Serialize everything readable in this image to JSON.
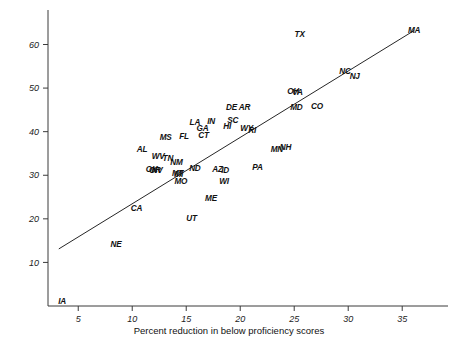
{
  "figure": {
    "background_color": "#ffffff",
    "axis_color": "#3b3b3b",
    "line_color": "#262626",
    "label_color": "#111111"
  },
  "chart_data": {
    "type": "scatter",
    "title": "",
    "subtitle": "",
    "xlabel": "Percent reduction in below proficiency scores",
    "ylabel": "",
    "xlim": [
      2.2,
      38.5
    ],
    "ylim": [
      0,
      67
    ],
    "xticks": [
      5,
      10,
      15,
      20,
      25,
      30,
      35
    ],
    "yticks": [
      10,
      20,
      30,
      40,
      50,
      60
    ],
    "grid": false,
    "legend": null,
    "point_marker": "text-label",
    "annotations": [
      {
        "label": "IA",
        "x": 3.5,
        "y": 0.4
      },
      {
        "label": "NE",
        "x": 8.5,
        "y": 13.6
      },
      {
        "label": "CA",
        "x": 10.4,
        "y": 21.8
      },
      {
        "label": "AL",
        "x": 10.9,
        "y": 35.3
      },
      {
        "label": "MS",
        "x": 13.1,
        "y": 38.1
      },
      {
        "label": "WV",
        "x": 12.4,
        "y": 33.8
      },
      {
        "label": "OK",
        "x": 11.8,
        "y": 30.8
      },
      {
        "label": "OR",
        "x": 12.1,
        "y": 30.6
      },
      {
        "label": "NV",
        "x": 12.3,
        "y": 30.5
      },
      {
        "label": "TN",
        "x": 13.3,
        "y": 33.3
      },
      {
        "label": "NM",
        "x": 14.1,
        "y": 32.4
      },
      {
        "label": "MT",
        "x": 14.2,
        "y": 29.8
      },
      {
        "label": "MI",
        "x": 14.3,
        "y": 29.6
      },
      {
        "label": "MO",
        "x": 14.5,
        "y": 28.0
      },
      {
        "label": "FL",
        "x": 14.8,
        "y": 38.3
      },
      {
        "label": "UT",
        "x": 15.5,
        "y": 19.4
      },
      {
        "label": "LA",
        "x": 15.8,
        "y": 41.6
      },
      {
        "label": "ND",
        "x": 15.8,
        "y": 31.0
      },
      {
        "label": "GA",
        "x": 16.5,
        "y": 40.2
      },
      {
        "label": "CT",
        "x": 16.6,
        "y": 38.6
      },
      {
        "label": "IN",
        "x": 17.3,
        "y": 41.7
      },
      {
        "label": "ME",
        "x": 17.3,
        "y": 24.1
      },
      {
        "label": "AZ",
        "x": 17.9,
        "y": 30.7
      },
      {
        "label": "ID",
        "x": 18.6,
        "y": 30.6
      },
      {
        "label": "WI",
        "x": 18.5,
        "y": 28.0
      },
      {
        "label": "HI",
        "x": 18.8,
        "y": 40.6
      },
      {
        "label": "SC",
        "x": 19.3,
        "y": 42.0
      },
      {
        "label": "DE",
        "x": 19.2,
        "y": 45.0
      },
      {
        "label": "AR",
        "x": 20.4,
        "y": 44.9
      },
      {
        "label": "WY",
        "x": 20.6,
        "y": 40.2
      },
      {
        "label": "RI",
        "x": 21.1,
        "y": 39.8
      },
      {
        "label": "PA",
        "x": 21.6,
        "y": 31.1
      },
      {
        "label": "MN",
        "x": 23.4,
        "y": 35.3
      },
      {
        "label": "NH",
        "x": 24.2,
        "y": 35.9
      },
      {
        "label": "OH",
        "x": 24.9,
        "y": 48.6
      },
      {
        "label": "VA",
        "x": 25.3,
        "y": 48.5
      },
      {
        "label": "MD",
        "x": 25.2,
        "y": 44.9
      },
      {
        "label": "TX",
        "x": 25.5,
        "y": 61.7
      },
      {
        "label": "CO",
        "x": 27.1,
        "y": 45.1
      },
      {
        "label": "NC",
        "x": 29.7,
        "y": 53.3
      },
      {
        "label": "NJ",
        "x": 30.6,
        "y": 52.2
      },
      {
        "label": "MA",
        "x": 36.1,
        "y": 62.6
      }
    ],
    "fit_line": {
      "description": "regression line",
      "x_start": 3.2,
      "y_start": 13.1,
      "x_end": 36.1,
      "y_end": 63.2
    }
  }
}
